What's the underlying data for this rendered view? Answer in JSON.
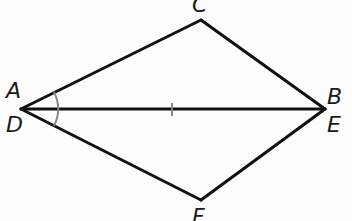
{
  "diagram": {
    "type": "geometry",
    "colors": {
      "stroke": "#111111",
      "marking": "#888888",
      "background": "#fdfdfd",
      "label": "#1a1a1a"
    },
    "vertices": {
      "left": {
        "x": 21,
        "y": 109,
        "labels": [
          "A",
          "D"
        ]
      },
      "right": {
        "x": 325,
        "y": 109,
        "labels": [
          "B",
          "E"
        ]
      },
      "top": {
        "x": 201,
        "y": 20,
        "labels": [
          "C"
        ]
      },
      "bottom": {
        "x": 201,
        "y": 200,
        "labels": [
          "F"
        ]
      }
    },
    "labels": {
      "A": "A",
      "B": "B",
      "C": "C",
      "D": "D",
      "E": "E",
      "F": "F"
    },
    "segments": [
      {
        "name": "AC",
        "from": "left",
        "to": "top"
      },
      {
        "name": "CB",
        "from": "top",
        "to": "right"
      },
      {
        "name": "AB / DE",
        "from": "left",
        "to": "right"
      },
      {
        "name": "DF",
        "from": "left",
        "to": "bottom"
      },
      {
        "name": "FE",
        "from": "bottom",
        "to": "right"
      }
    ],
    "markings": {
      "angle_arc": {
        "vertex": "A/D",
        "radius": 38,
        "count": 1
      },
      "tick_mark": {
        "segment": "AB/DE",
        "x": 172,
        "count": 1
      }
    }
  }
}
